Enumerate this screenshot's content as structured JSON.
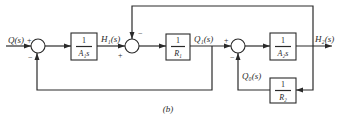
{
  "caption": "(b)",
  "signals": {
    "input": "Q(s)",
    "h1": "H₁(s)",
    "q1": "Q₁(s)",
    "h2": "H₂(s)",
    "q0": "Q₀(s)"
  },
  "blocks": [
    {
      "id": "block-1-over-A1s",
      "numerator": "1",
      "denominator": "A₁s"
    },
    {
      "id": "block-1-over-R1",
      "numerator": "1",
      "denominator": "R₁"
    },
    {
      "id": "block-1-over-A2s",
      "numerator": "1",
      "denominator": "A₂s"
    },
    {
      "id": "block-1-over-R2",
      "numerator": "1",
      "denominator": "R₂"
    }
  ],
  "summing_junctions": [
    {
      "id": "sum-1",
      "signs": {
        "left": "+",
        "bottom": "−"
      }
    },
    {
      "id": "sum-2",
      "signs": {
        "left": "+",
        "top": "−"
      }
    },
    {
      "id": "sum-3",
      "signs": {
        "left": "+",
        "bottom": "−"
      }
    }
  ],
  "colors": {
    "line": "#2a2a2a",
    "background": "#ffffff"
  }
}
